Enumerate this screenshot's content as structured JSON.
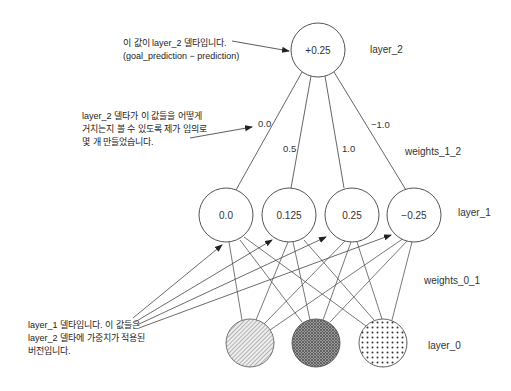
{
  "diagram": {
    "layer_2": {
      "label": "layer_2",
      "nodes": [
        {
          "value": "+0.25"
        }
      ]
    },
    "weights_1_2": {
      "label": "weights_1_2",
      "values": [
        "0.0",
        "0.5",
        "1.0",
        "−1.0"
      ]
    },
    "layer_1": {
      "label": "layer_1",
      "nodes": [
        {
          "value": "0.0"
        },
        {
          "value": "0.125"
        },
        {
          "value": "0.25"
        },
        {
          "value": "−0.25"
        }
      ]
    },
    "weights_0_1": {
      "label": "weights_0_1"
    },
    "layer_0": {
      "label": "layer_0",
      "nodes": [
        {
          "pattern": "diagonal-hatch-light"
        },
        {
          "pattern": "crosshatch-dark"
        },
        {
          "pattern": "dots"
        }
      ]
    },
    "annotations": [
      {
        "lines": [
          "이 값이 layer_2 델타입니다.",
          "(goal_prediction − prediction)"
        ]
      },
      {
        "lines": [
          "layer_2 델타가 이 값들을 어떻게",
          "거치는지 볼 수 있도록 제가 임의로",
          "몇 개 만들었습니다."
        ]
      },
      {
        "lines": [
          "layer_1 델타입니다. 이 값들은",
          "layer_2 델타에 가중치가 적용된",
          "버전입니다."
        ]
      }
    ],
    "colors": {
      "stroke": "#555555",
      "text": "#333333",
      "background": "#ffffff"
    }
  }
}
